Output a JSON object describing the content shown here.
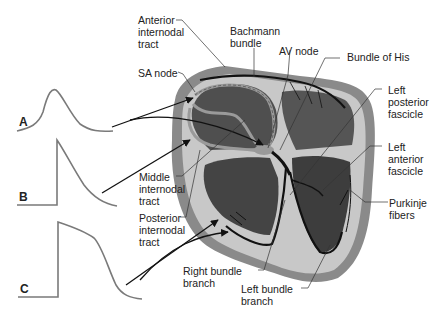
{
  "diagram": {
    "labels": {
      "anterior_internodal_tract": "Anterior\ninternodal\ntract",
      "sa_node": "SA node",
      "bachmann_bundle": "Bachmann\nbundle",
      "av_node": "AV node",
      "bundle_of_his": "Bundle of His",
      "left_posterior_fascicle": "Left\nposterior\nfascicle",
      "left_anterior_fascicle": "Left\nanterior\nfascicle",
      "purkinje_fibers": "Purkinje\nfibers",
      "middle_internodal_tract": "Middle\ninternodal\ntract",
      "posterior_internodal_tract": "Posterior\ninternodal\ntract",
      "right_bundle_branch": "Right bundle\nbranch",
      "left_bundle_branch": "Left bundle\nbranch"
    },
    "waveforms": [
      {
        "id": "A",
        "label": "A",
        "description": "slow-response nodal action potential"
      },
      {
        "id": "B",
        "label": "B",
        "description": "atrial action potential"
      },
      {
        "id": "C",
        "label": "C",
        "description": "ventricular action potential with plateau"
      }
    ],
    "colors": {
      "background": "#ffffff",
      "text": "#222222",
      "waveform": "#7a7a7a",
      "heart_outer": "#8a8a8a",
      "heart_wall_light": "#c8c8c8",
      "chamber_dark": "#4a4a4a",
      "conduction_path": "#111111",
      "internodal_gray": "#9a9a9a"
    }
  }
}
